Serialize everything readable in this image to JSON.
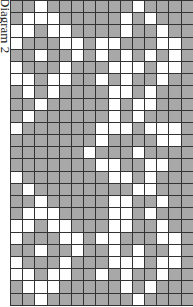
{
  "title": "Diagram 2",
  "colors": {
    "shaded": "#a8a8a8",
    "empty": "#ffffff",
    "grid_line": "#333333"
  },
  "grid": {
    "columns": 15,
    "rows": 25,
    "legend": {
      "G": "shaded",
      "W": "empty"
    },
    "cells": [
      "GGWGGGGGGGWGGGG",
      "GWWWGGGGGWGWGGG",
      "WWGWWGGGGWGGWGG",
      "WGGGWWGWWGGGWWG",
      "GGWGGWGWGWGWGWG",
      "WGGGWGGGWWWGWWG",
      "WWGWWGGWGWGGWGG",
      "GWGWGGGGWWGWGGG",
      "GGWGGGGGWGWWGGG",
      "GWGGGGGGWGWGGGG",
      "WGGGGGGWWWGWWWG",
      "GGGGGGGWGGGGWWG",
      "GGGGGGWGGGWGGGG",
      "GGGGGGGWWGGWWGG",
      "WGGGGGGGWWGWGGG",
      "GWGGGGGGGGWWGGG",
      "GGWGGGGGWWGGWGG",
      "GWWWGGGGWWGWGGG",
      "WWGWWGGGWWGGWGG",
      "WGGGWWGWWGGGWWG",
      "GGWGGWGGWGWGGWG",
      "WGGGWGGGWWWGWWG",
      "WWGWWGGWGWGGWGG",
      "GWWWGGGGGWGWGGG",
      "GGWGGGGGGGWGGGG"
    ]
  }
}
